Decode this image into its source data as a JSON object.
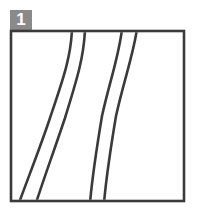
{
  "figure": {
    "panel_label": "1",
    "panel_label_icon": "panel-index-badge",
    "background_color": "#ffffff",
    "badge": {
      "fill_color": "#8a8a8a",
      "text_color": "#ffffff",
      "x": 10,
      "y": 10,
      "width": 22,
      "height": 21
    },
    "frame": {
      "stroke_color": "#3a3a3a",
      "fill_color": "#ffffff",
      "stroke_width": 2.6,
      "x": 11,
      "y": 31,
      "width": 173,
      "height": 170
    },
    "line_art": {
      "stroke_color": "#3a3a3a",
      "stroke_width": 2.6,
      "description": "two pairs of parallel S-shaped contour curves",
      "curve_count": 4,
      "curves": [
        {
          "name": "left-pair-outer",
          "top_x": 72,
          "bottom_x": 20,
          "path": "M 72 31 C 71 58, 62 82, 50 118 C 40 148, 28 176, 20 201"
        },
        {
          "name": "left-pair-inner",
          "top_x": 84,
          "bottom_x": 36,
          "path": "M 84 31 C 84 58, 76 82, 65 118 C 55 148, 44 176, 36 201"
        },
        {
          "name": "right-pair-outer",
          "top_x": 122,
          "bottom_x": 90,
          "path": "M 122 31 C 119 56, 110 80, 103 116 C 98 146, 93 178, 90 201"
        },
        {
          "name": "right-pair-inner",
          "top_x": 136,
          "bottom_x": 104,
          "path": "M 136 31 C 132 56, 123 80, 116 116 C 111 146, 106 178, 104 201"
        }
      ]
    }
  }
}
